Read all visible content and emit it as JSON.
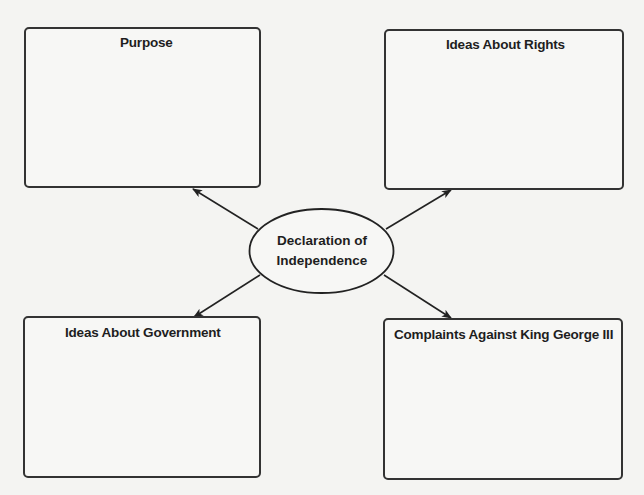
{
  "diagram": {
    "type": "concept-map",
    "center": {
      "line1": "Declaration of",
      "line2": "Independence"
    },
    "boxes": [
      {
        "id": "purpose",
        "title": "Purpose",
        "position": "top-left"
      },
      {
        "id": "rights",
        "title": "Ideas About Rights",
        "position": "top-right"
      },
      {
        "id": "government",
        "title": "Ideas About Government",
        "position": "bottom-left"
      },
      {
        "id": "complaints",
        "title": "Complaints Against King George III",
        "position": "bottom-right"
      }
    ],
    "colors": {
      "background": "#f4f4f2",
      "stroke": "#333333",
      "text": "#1e1e1e"
    }
  }
}
